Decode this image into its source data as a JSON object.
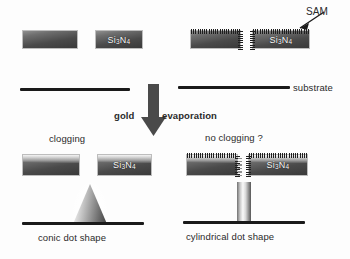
{
  "figure": {
    "material_label": "Si3N4",
    "material_label_parts": {
      "si": "Si",
      "sub1": "3",
      "n": "N",
      "sub2": "4"
    }
  },
  "annotations": {
    "sam": "SAM",
    "substrate": "substrate",
    "gold": "gold",
    "evaporation": "evaporation",
    "clogging": "clogging",
    "no_clogging": "no clogging ?",
    "conic_dot_shape": "conic dot shape",
    "cylindrical_dot_shape": "cylindrical dot shape"
  },
  "panels": {
    "top_left": {
      "name": "uncoated-membrane-before",
      "coating": "none"
    },
    "top_right": {
      "name": "sam-coated-membrane-before",
      "coating": "SAM"
    },
    "bottom_left": {
      "name": "uncoated-membrane-after",
      "result": "clogging",
      "deposit": "cone"
    },
    "bottom_right": {
      "name": "sam-coated-membrane-after",
      "result": "no clogging ?",
      "deposit": "cylinder"
    }
  },
  "colors": {
    "line": "#1a1a1a",
    "text": "#2a2a2a",
    "nitride_dark": "#3a3a3a",
    "nitride_light": "#8f8f8f",
    "gold_light": "#f4f4f4",
    "background": "#fdfdfd"
  }
}
